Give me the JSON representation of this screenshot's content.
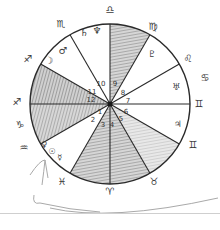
{
  "chart": {
    "center": [
      110,
      104
    ],
    "radius": 80,
    "line_color": "#2a2a2a",
    "shade_color": "#9a9a9a"
  },
  "signs": [
    {
      "name": "libra",
      "glyph": "♎",
      "x": 110,
      "y": 10
    },
    {
      "name": "virgo",
      "glyph": "♍",
      "x": 153,
      "y": 28
    },
    {
      "name": "leo",
      "glyph": "♌",
      "x": 187,
      "y": 60
    },
    {
      "name": "cancer",
      "glyph": "♋",
      "x": 205,
      "y": 80
    },
    {
      "name": "gemini-top",
      "glyph": "♊",
      "x": 199,
      "y": 106
    },
    {
      "name": "gemini-bottom",
      "glyph": "♊",
      "x": 194,
      "y": 146
    },
    {
      "name": "taurus",
      "glyph": "♉",
      "x": 155,
      "y": 183
    },
    {
      "name": "aries",
      "glyph": "♈",
      "x": 110,
      "y": 192
    },
    {
      "name": "pisces",
      "glyph": "♓",
      "x": 62,
      "y": 182
    },
    {
      "name": "aquarius",
      "glyph": "♒",
      "x": 24,
      "y": 150
    },
    {
      "name": "capricorn",
      "glyph": "♑",
      "x": 20,
      "y": 127
    },
    {
      "name": "sagittarius-mid",
      "glyph": "♐",
      "x": 17,
      "y": 103
    },
    {
      "name": "sagittarius-top",
      "glyph": "♐",
      "x": 28,
      "y": 60
    },
    {
      "name": "scorpio",
      "glyph": "♏",
      "x": 61,
      "y": 25
    }
  ],
  "planets": [
    {
      "name": "saturn",
      "glyph": "♄",
      "x": 84,
      "y": 34
    },
    {
      "name": "neptune",
      "glyph": "♆",
      "x": 97,
      "y": 32
    },
    {
      "name": "moon",
      "glyph": "☽",
      "x": 49,
      "y": 62
    },
    {
      "name": "mars",
      "glyph": "♂",
      "x": 63,
      "y": 51
    },
    {
      "name": "pluto",
      "glyph": "♇",
      "x": 152,
      "y": 55
    },
    {
      "name": "uranus",
      "glyph": "♅",
      "x": 176,
      "y": 88
    },
    {
      "name": "jupiter",
      "glyph": "♃",
      "x": 178,
      "y": 125
    },
    {
      "name": "venus",
      "glyph": "♀",
      "x": 44,
      "y": 145
    },
    {
      "name": "sun",
      "glyph": "☉",
      "x": 52,
      "y": 151
    },
    {
      "name": "mercury",
      "glyph": "☿",
      "x": 60,
      "y": 158
    }
  ],
  "houses": [
    {
      "n": "1",
      "x": 100,
      "y": 112
    },
    {
      "n": "2",
      "x": 93,
      "y": 120
    },
    {
      "n": "3",
      "x": 103,
      "y": 124
    },
    {
      "n": "4",
      "x": 112,
      "y": 125
    },
    {
      "n": "5",
      "x": 121,
      "y": 119
    },
    {
      "n": "6",
      "x": 126,
      "y": 112
    },
    {
      "n": "7",
      "x": 127,
      "y": 102
    },
    {
      "n": "8",
      "x": 123,
      "y": 93
    },
    {
      "n": "9",
      "x": 115,
      "y": 84
    },
    {
      "n": "10",
      "x": 100,
      "y": 84
    },
    {
      "n": "11",
      "x": 92,
      "y": 92
    },
    {
      "n": "12",
      "x": 91,
      "y": 100
    }
  ]
}
